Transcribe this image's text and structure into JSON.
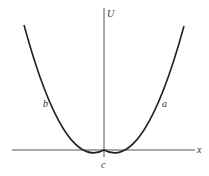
{
  "diagram": {
    "type": "potential-energy-curve",
    "axes": {
      "vertical_label": "U",
      "horizontal_label": "x"
    },
    "curve": {
      "shape": "parabola",
      "left_branch_label": "b",
      "right_branch_label": "a",
      "minimum_label": "c"
    },
    "colors": {
      "axis": "#555555",
      "curve": "#222222",
      "text": "#333333"
    }
  }
}
